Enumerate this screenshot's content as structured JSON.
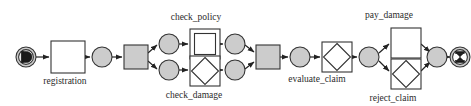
{
  "diagram": {
    "kind": "petri-net-workflow",
    "title": "",
    "colors": {
      "place": "#cccccc",
      "transition_gray": "#cccccc",
      "transition_white": "#ffffff",
      "stroke": "#333333",
      "arc": "#222222",
      "label_text": "#2b2b2b",
      "background": "#ffffff",
      "marker": "#1a1a1a"
    },
    "labels": {
      "registration": "registration",
      "check_policy": "check_policy",
      "check_damage": "check_damage",
      "evaluate_claim": "evaluate_claim",
      "pay_damage": "pay_damage",
      "reject_claim": "reject_claim"
    },
    "nodes": [
      {
        "id": "start",
        "type": "place-start",
        "icon": "start-marker-icon",
        "cx": 26,
        "cy": 57,
        "r": 10
      },
      {
        "id": "registration",
        "type": "transition-plain",
        "x": 51,
        "y": 41,
        "w": 34,
        "h": 32,
        "label": "registration"
      },
      {
        "id": "p1",
        "type": "place",
        "cx": 102,
        "cy": 57,
        "r": 10
      },
      {
        "id": "split",
        "type": "transition-silent",
        "x": 124,
        "y": 45,
        "w": 24,
        "h": 24
      },
      {
        "id": "p_top",
        "type": "place",
        "cx": 169,
        "cy": 44,
        "r": 10
      },
      {
        "id": "p_bottom",
        "type": "place",
        "cx": 169,
        "cy": 70,
        "r": 10
      },
      {
        "id": "check_policy",
        "type": "transition-nested-square",
        "x": 190,
        "y": 29,
        "w": 30,
        "h": 30,
        "label": "check_policy"
      },
      {
        "id": "check_damage",
        "type": "transition-diamond",
        "x": 190,
        "y": 56,
        "w": 30,
        "h": 30,
        "label": "check_damage"
      },
      {
        "id": "p_top2",
        "type": "place",
        "cx": 235,
        "cy": 44,
        "r": 10
      },
      {
        "id": "p_bottom2",
        "type": "place",
        "cx": 235,
        "cy": 70,
        "r": 10
      },
      {
        "id": "join",
        "type": "transition-silent",
        "x": 256,
        "y": 45,
        "w": 24,
        "h": 24
      },
      {
        "id": "p2",
        "type": "place",
        "cx": 300,
        "cy": 57,
        "r": 10
      },
      {
        "id": "evaluate_claim",
        "type": "transition-diamond",
        "x": 322,
        "y": 42,
        "w": 30,
        "h": 30,
        "label": "evaluate_claim"
      },
      {
        "id": "p3",
        "type": "place",
        "cx": 369,
        "cy": 57,
        "r": 10
      },
      {
        "id": "pay_damage",
        "type": "transition-plain",
        "x": 391,
        "y": 28,
        "w": 30,
        "h": 30,
        "label": "pay_damage"
      },
      {
        "id": "reject_claim",
        "type": "transition-diamond",
        "x": 391,
        "y": 59,
        "w": 30,
        "h": 30,
        "label": "reject_claim"
      },
      {
        "id": "p4",
        "type": "place",
        "cx": 437,
        "cy": 57,
        "r": 10
      },
      {
        "id": "end",
        "type": "place-end",
        "icon": "end-marker-icon",
        "cx": 460,
        "cy": 57,
        "r": 10
      }
    ],
    "arcs": [
      {
        "from": "start",
        "to": "registration"
      },
      {
        "from": "registration",
        "to": "p1"
      },
      {
        "from": "p1",
        "to": "split"
      },
      {
        "from": "split",
        "to": "p_top"
      },
      {
        "from": "split",
        "to": "p_bottom"
      },
      {
        "from": "p_top",
        "to": "check_policy"
      },
      {
        "from": "p_bottom",
        "to": "check_damage"
      },
      {
        "from": "check_policy",
        "to": "p_top2"
      },
      {
        "from": "check_damage",
        "to": "p_bottom2"
      },
      {
        "from": "p_top2",
        "to": "join"
      },
      {
        "from": "p_bottom2",
        "to": "join"
      },
      {
        "from": "join",
        "to": "p2"
      },
      {
        "from": "p2",
        "to": "evaluate_claim"
      },
      {
        "from": "evaluate_claim",
        "to": "p3"
      },
      {
        "from": "p3",
        "to": "pay_damage"
      },
      {
        "from": "p3",
        "to": "reject_claim"
      },
      {
        "from": "pay_damage",
        "to": "p4"
      },
      {
        "from": "reject_claim",
        "to": "p4"
      },
      {
        "from": "p4",
        "to": "end"
      }
    ]
  }
}
